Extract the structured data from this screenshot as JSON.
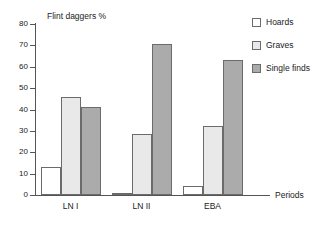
{
  "chart_data": {
    "type": "bar",
    "title": "Flint daggers %",
    "xlabel": "Periods",
    "ylabel": "",
    "categories": [
      "LN I",
      "LN II",
      "EBA"
    ],
    "series": [
      {
        "name": "Hoards",
        "color": "#ffffff",
        "values": [
          13,
          1,
          4
        ]
      },
      {
        "name": "Graves",
        "color": "#e9e9e9",
        "values": [
          46,
          28.5,
          32.5
        ]
      },
      {
        "name": "Single finds",
        "color": "#ababab",
        "values": [
          41,
          70.5,
          63
        ]
      }
    ],
    "ylim": [
      0,
      80
    ],
    "ytick_step": 10,
    "yticks": [
      0,
      10,
      20,
      30,
      40,
      50,
      60,
      70,
      80
    ],
    "ytick_labels": [
      "0",
      "10",
      "20",
      "30",
      "40",
      "50",
      "60",
      "70",
      "80"
    ],
    "grid": false,
    "legend_position": "top-right",
    "bar_edge_color": "#6b6b6b",
    "axis_color": "#555555"
  }
}
